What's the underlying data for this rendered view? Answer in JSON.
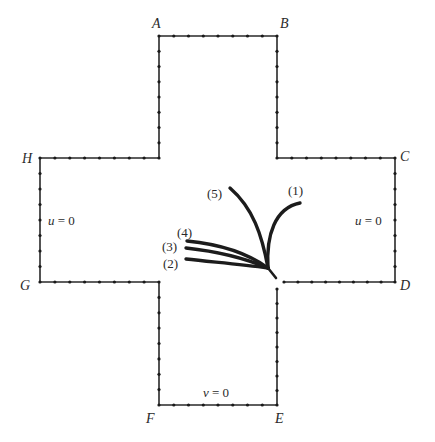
{
  "diagram": {
    "type": "cross-shaped domain with boundary nodes and curves",
    "colors": {
      "boundary": "#2a2a2a",
      "curves": "#1c1c1c",
      "background": "#ffffff"
    },
    "corners": [
      {
        "id": "A",
        "label": "A",
        "x": 159,
        "y": 36,
        "lx": 152,
        "ly": 28
      },
      {
        "id": "B",
        "label": "B",
        "x": 277,
        "y": 36,
        "lx": 280,
        "ly": 28
      },
      {
        "id": "C",
        "label": "C",
        "x": 395,
        "y": 158,
        "lx": 400,
        "ly": 161
      },
      {
        "id": "D",
        "label": "D",
        "x": 395,
        "y": 282,
        "lx": 400,
        "ly": 290
      },
      {
        "id": "E",
        "label": "E",
        "x": 277,
        "y": 405,
        "lx": 275,
        "ly": 423
      },
      {
        "id": "F",
        "label": "F",
        "x": 159,
        "y": 405,
        "lx": 146,
        "ly": 423
      },
      {
        "id": "G",
        "label": "G",
        "x": 40,
        "y": 282,
        "lx": 20,
        "ly": 290
      },
      {
        "id": "H",
        "label": "H",
        "x": 40,
        "y": 158,
        "lx": 22,
        "ly": 163
      }
    ],
    "boundary_conditions": [
      {
        "id": "left",
        "var": "u",
        "rest": " = 0",
        "x": 48,
        "y": 225
      },
      {
        "id": "right",
        "var": "u",
        "rest": " = 0",
        "x": 355,
        "y": 225
      },
      {
        "id": "bottom",
        "var": "v",
        "rest": " = 0",
        "x": 203,
        "y": 397
      }
    ],
    "curves": [
      {
        "id": "1",
        "label": "(1)",
        "lx": 288,
        "ly": 195
      },
      {
        "id": "2",
        "label": "(2)",
        "lx": 163,
        "ly": 268
      },
      {
        "id": "3",
        "label": "(3)",
        "lx": 162,
        "ly": 251
      },
      {
        "id": "4",
        "label": "(4)",
        "lx": 177,
        "ly": 237
      },
      {
        "id": "5",
        "label": "(5)",
        "lx": 207,
        "ly": 198
      }
    ]
  }
}
